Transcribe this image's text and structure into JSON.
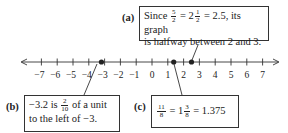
{
  "number_line": {
    "min": -7,
    "max": 7,
    "tick_labels": [
      "−7",
      "−6",
      "−5",
      "−4",
      "−3",
      "−2",
      "−1",
      "0",
      "1",
      "2",
      "3",
      "4",
      "5",
      "6",
      "7"
    ],
    "points": [
      -3.2,
      1.375,
      2.5
    ]
  },
  "callouts": {
    "a": {
      "label": "(a)",
      "line1_prefix": "Since",
      "frac1_num": "5",
      "frac1_den": "2",
      "eq1": "= 2",
      "frac2_num": "1",
      "frac2_den": "2",
      "line1_suffix": "= 2.5, its graph",
      "line2": "is halfway between 2 and 3."
    },
    "b": {
      "label": "(b)",
      "line1_prefix": "−3.2 is",
      "frac_num": "2",
      "frac_den": "10",
      "line1_suffix": "of a unit",
      "line2": "to the left of −3."
    },
    "c": {
      "label": "(c)",
      "frac1_num": "11",
      "frac1_den": "8",
      "eq1": "= 1",
      "frac2_num": "3",
      "frac2_den": "8",
      "suffix": "= 1.375"
    }
  }
}
